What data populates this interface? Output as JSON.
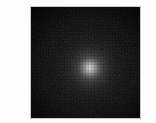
{
  "figure": {
    "kind": "grayscale-intensity-image",
    "background_color": "#fdfdfd",
    "panel": {
      "border_color": "#c9c9c9",
      "field_color": "#050505",
      "left_px": 30,
      "top_px": 6,
      "width_px": 111,
      "height_px": 113
    },
    "source": {
      "label": "glow-source",
      "center_x_px": 89,
      "center_y_px": 67,
      "peak_color": "#d6d6d4",
      "core_radius_px": 7,
      "halo_radius_px": 29,
      "falloff": "gaussian"
    },
    "colors": {
      "peak": "#d6d6d4",
      "midtone": "#6b6b6a",
      "floor": "#050505",
      "border": "#c9c9c9",
      "page_background": "#fdfdfd"
    }
  },
  "chart_data": {
    "type": "heatmap",
    "title": "",
    "xlabel": "",
    "ylabel": "",
    "grid": false,
    "legend": "none",
    "colormap": "gray",
    "x": [
      0,
      1,
      2,
      3,
      4,
      5,
      6,
      7,
      8,
      9,
      10
    ],
    "y": [
      0,
      1,
      2,
      3,
      4,
      5,
      6,
      7,
      8,
      9,
      10
    ],
    "xlim": [
      0,
      10
    ],
    "ylim": [
      0,
      10
    ],
    "zlim": [
      0,
      214
    ],
    "peak_position": [
      5.4,
      5.4
    ],
    "values": [
      [
        1,
        1,
        2,
        2,
        3,
        3,
        3,
        2,
        2,
        1,
        1
      ],
      [
        1,
        2,
        3,
        4,
        5,
        6,
        5,
        4,
        3,
        2,
        1
      ],
      [
        2,
        3,
        5,
        7,
        10,
        12,
        11,
        8,
        5,
        3,
        2
      ],
      [
        2,
        4,
        7,
        13,
        22,
        28,
        25,
        16,
        9,
        4,
        2
      ],
      [
        3,
        5,
        10,
        22,
        52,
        80,
        66,
        32,
        13,
        6,
        3
      ],
      [
        3,
        6,
        12,
        28,
        80,
        214,
        120,
        45,
        16,
        6,
        3
      ],
      [
        3,
        5,
        11,
        25,
        66,
        120,
        78,
        34,
        13,
        5,
        3
      ],
      [
        2,
        4,
        8,
        16,
        32,
        45,
        34,
        19,
        9,
        4,
        2
      ],
      [
        2,
        3,
        5,
        9,
        13,
        16,
        13,
        9,
        5,
        3,
        2
      ],
      [
        1,
        2,
        3,
        4,
        6,
        6,
        5,
        4,
        3,
        2,
        1
      ],
      [
        1,
        1,
        2,
        2,
        3,
        3,
        3,
        2,
        2,
        1,
        1
      ]
    ]
  }
}
